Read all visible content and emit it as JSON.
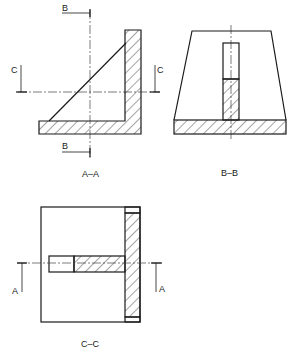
{
  "drawing": {
    "type": "engineering sectional views",
    "colors": {
      "line": "#1a1a1a",
      "background": "#ffffff"
    },
    "views": [
      {
        "id": "A-A",
        "caption": "A–A",
        "cut_markers": {
          "top": "B",
          "bottom": "B",
          "left": "C",
          "right": "C"
        }
      },
      {
        "id": "B-B",
        "caption": "B–B"
      },
      {
        "id": "C-C",
        "caption": "C–C",
        "cut_markers": {
          "left": "A",
          "right": "A"
        }
      }
    ]
  },
  "labels": {
    "aa_caption": "A–A",
    "bb_caption": "B–B",
    "cc_caption": "C–C",
    "b_top": "B",
    "b_bottom": "B",
    "c_left": "C",
    "c_right": "C",
    "a_left": "A",
    "a_right": "A"
  }
}
